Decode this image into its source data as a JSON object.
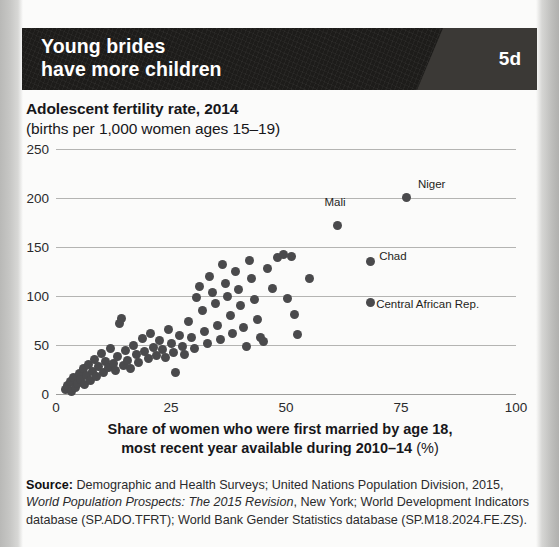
{
  "banner": {
    "title_line1": "Young brides",
    "title_line2": "have more children",
    "badge": "5d",
    "background_color": "#1d1c1a",
    "badge_color": "#3b3936"
  },
  "chart_data": {
    "type": "scatter",
    "title": "Adolescent fertility rate, 2014",
    "subtitle": "(births per 1,000 women ages 15–19)",
    "xlabel_line1": "Share of women who were first married by age 18,",
    "xlabel_line2": "most recent year available during 2010–14",
    "xlabel_units": "(%)",
    "ylabel": "",
    "xlim": [
      0,
      100
    ],
    "ylim": [
      0,
      250
    ],
    "xticks": [
      0,
      25,
      50,
      75,
      100
    ],
    "yticks": [
      0,
      50,
      100,
      150,
      200,
      250
    ],
    "grid": true,
    "legend": "none",
    "marker_color": "#4a4a4c",
    "points": [
      {
        "x": 2.0,
        "y": 5
      },
      {
        "x": 2.6,
        "y": 9
      },
      {
        "x": 3.1,
        "y": 13
      },
      {
        "x": 3.4,
        "y": 3
      },
      {
        "x": 3.8,
        "y": 17
      },
      {
        "x": 4.2,
        "y": 7
      },
      {
        "x": 4.6,
        "y": 11
      },
      {
        "x": 5.0,
        "y": 21
      },
      {
        "x": 5.4,
        "y": 15
      },
      {
        "x": 5.9,
        "y": 26
      },
      {
        "x": 6.2,
        "y": 10
      },
      {
        "x": 6.6,
        "y": 19
      },
      {
        "x": 7.0,
        "y": 30
      },
      {
        "x": 7.4,
        "y": 14
      },
      {
        "x": 7.9,
        "y": 23
      },
      {
        "x": 8.3,
        "y": 35
      },
      {
        "x": 8.8,
        "y": 18
      },
      {
        "x": 9.2,
        "y": 28
      },
      {
        "x": 9.8,
        "y": 41
      },
      {
        "x": 10.3,
        "y": 22
      },
      {
        "x": 10.8,
        "y": 33
      },
      {
        "x": 11.4,
        "y": 27
      },
      {
        "x": 11.9,
        "y": 46
      },
      {
        "x": 12.4,
        "y": 31
      },
      {
        "x": 12.9,
        "y": 24
      },
      {
        "x": 13.4,
        "y": 38
      },
      {
        "x": 13.9,
        "y": 72
      },
      {
        "x": 14.3,
        "y": 77
      },
      {
        "x": 14.6,
        "y": 29
      },
      {
        "x": 15.1,
        "y": 44
      },
      {
        "x": 15.6,
        "y": 34
      },
      {
        "x": 16.2,
        "y": 26
      },
      {
        "x": 16.8,
        "y": 50
      },
      {
        "x": 17.4,
        "y": 40
      },
      {
        "x": 18.0,
        "y": 32
      },
      {
        "x": 18.7,
        "y": 57
      },
      {
        "x": 19.3,
        "y": 43
      },
      {
        "x": 20.0,
        "y": 36
      },
      {
        "x": 20.6,
        "y": 62
      },
      {
        "x": 21.2,
        "y": 47
      },
      {
        "x": 21.8,
        "y": 39
      },
      {
        "x": 22.5,
        "y": 55
      },
      {
        "x": 23.1,
        "y": 45
      },
      {
        "x": 23.8,
        "y": 37
      },
      {
        "x": 24.4,
        "y": 66
      },
      {
        "x": 25.0,
        "y": 52
      },
      {
        "x": 25.6,
        "y": 42
      },
      {
        "x": 26.0,
        "y": 22
      },
      {
        "x": 26.8,
        "y": 60
      },
      {
        "x": 27.4,
        "y": 48
      },
      {
        "x": 28.0,
        "y": 40
      },
      {
        "x": 28.8,
        "y": 74
      },
      {
        "x": 29.4,
        "y": 58
      },
      {
        "x": 30.0,
        "y": 46
      },
      {
        "x": 30.6,
        "y": 98
      },
      {
        "x": 31.2,
        "y": 110
      },
      {
        "x": 31.8,
        "y": 85
      },
      {
        "x": 32.3,
        "y": 64
      },
      {
        "x": 32.9,
        "y": 52
      },
      {
        "x": 33.4,
        "y": 120
      },
      {
        "x": 34.0,
        "y": 104
      },
      {
        "x": 34.6,
        "y": 92
      },
      {
        "x": 35.1,
        "y": 70
      },
      {
        "x": 35.7,
        "y": 56
      },
      {
        "x": 36.2,
        "y": 132
      },
      {
        "x": 36.8,
        "y": 113
      },
      {
        "x": 37.3,
        "y": 100
      },
      {
        "x": 37.9,
        "y": 80
      },
      {
        "x": 38.4,
        "y": 62
      },
      {
        "x": 39.0,
        "y": 125
      },
      {
        "x": 39.6,
        "y": 107
      },
      {
        "x": 40.2,
        "y": 90
      },
      {
        "x": 40.8,
        "y": 68
      },
      {
        "x": 41.4,
        "y": 48
      },
      {
        "x": 42.0,
        "y": 136
      },
      {
        "x": 42.6,
        "y": 118
      },
      {
        "x": 43.2,
        "y": 96
      },
      {
        "x": 43.8,
        "y": 76
      },
      {
        "x": 44.4,
        "y": 58
      },
      {
        "x": 45.0,
        "y": 54
      },
      {
        "x": 46.0,
        "y": 128
      },
      {
        "x": 47.0,
        "y": 108
      },
      {
        "x": 48.2,
        "y": 139
      },
      {
        "x": 49.4,
        "y": 142
      },
      {
        "x": 50.4,
        "y": 97
      },
      {
        "x": 51.2,
        "y": 140
      },
      {
        "x": 51.8,
        "y": 81
      },
      {
        "x": 52.4,
        "y": 61
      },
      {
        "x": 55.0,
        "y": 118
      }
    ],
    "labeled_points": [
      {
        "name": "Niger",
        "x": 76.3,
        "y": 201,
        "label_dx": 11,
        "label_dy": -13
      },
      {
        "name": "Mali",
        "x": 61.2,
        "y": 172,
        "label_dx": -13,
        "label_dy": -23
      },
      {
        "name": "Chad",
        "x": 68.3,
        "y": 135,
        "label_dx": 9,
        "label_dy": -6
      },
      {
        "name": "Central African Rep.",
        "x": 68.3,
        "y": 93,
        "label_dx": 6,
        "label_dy": 1
      }
    ]
  },
  "source": {
    "label": "Source:",
    "text_1": " Demographic and Health Surveys; United Nations Population Division, 2015, ",
    "italic_1": "World Population Prospects: The 2015 Revision",
    "text_2": ", New York; World Development Indicators database (SP.ADO.TFRT); World Bank Gender Statistics database (SP.M18.2024.FE.ZS)."
  }
}
